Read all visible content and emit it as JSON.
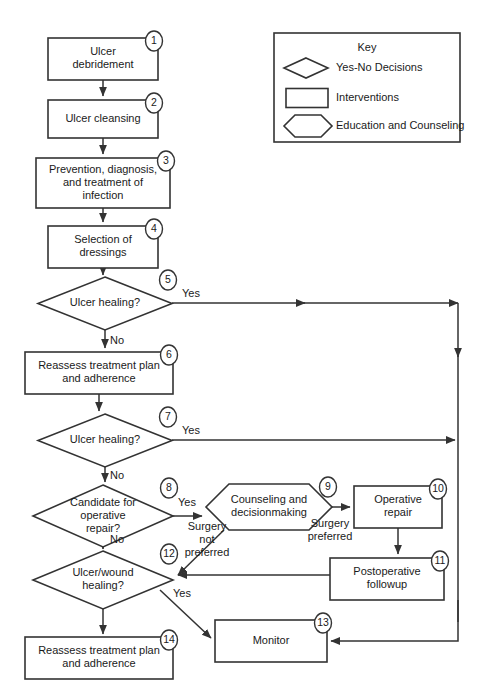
{
  "chart_data": {
    "type": "diagram",
    "diagram_kind": "clinical-algorithm-flowchart",
    "nodes": [
      {
        "id": 1,
        "badge": "1",
        "shape": "process",
        "lines": [
          "Ulcer",
          "debridement"
        ],
        "x": 48,
        "y": 38,
        "w": 110,
        "h": 42
      },
      {
        "id": 2,
        "badge": "2",
        "shape": "process",
        "lines": [
          "Ulcer cleansing"
        ],
        "x": 48,
        "y": 100,
        "w": 110,
        "h": 38
      },
      {
        "id": 3,
        "badge": "3",
        "shape": "process",
        "lines": [
          "Prevention, diagnosis,",
          "and treatment of",
          "infection"
        ],
        "x": 36,
        "y": 158,
        "w": 134,
        "h": 50
      },
      {
        "id": 4,
        "badge": "4",
        "shape": "process",
        "lines": [
          "Selection of",
          "dressings"
        ],
        "x": 48,
        "y": 226,
        "w": 110,
        "h": 42
      },
      {
        "id": 5,
        "badge": "5",
        "shape": "decision",
        "lines": [
          "Ulcer healing?"
        ],
        "x": 38,
        "y": 277,
        "w": 134,
        "h": 53
      },
      {
        "id": 6,
        "badge": "6",
        "shape": "process",
        "lines": [
          "Reassess treatment plan",
          "and adherence"
        ],
        "x": 25,
        "y": 352,
        "w": 148,
        "h": 42
      },
      {
        "id": 7,
        "badge": "7",
        "shape": "decision",
        "lines": [
          "Ulcer healing?"
        ],
        "x": 38,
        "y": 414,
        "w": 134,
        "h": 53
      },
      {
        "id": 8,
        "badge": "8",
        "shape": "decision",
        "lines": [
          "Candidate for",
          "operative",
          "repair?"
        ],
        "x": 33,
        "y": 485,
        "w": 140,
        "h": 62
      },
      {
        "id": 9,
        "badge": "9",
        "shape": "hexagon",
        "lines": [
          "Counseling and",
          "decisionmaking"
        ],
        "x": 206,
        "y": 484,
        "w": 126,
        "h": 46
      },
      {
        "id": 10,
        "badge": "10",
        "shape": "process",
        "lines": [
          "Operative",
          "repair"
        ],
        "x": 354,
        "y": 486,
        "w": 88,
        "h": 42
      },
      {
        "id": 11,
        "badge": "11",
        "shape": "process",
        "lines": [
          "Postoperative",
          "followup"
        ],
        "x": 330,
        "y": 558,
        "w": 114,
        "h": 42
      },
      {
        "id": 12,
        "badge": "12",
        "shape": "decision",
        "lines": [
          "Ulcer/wound",
          "healing?"
        ],
        "x": 33,
        "y": 551,
        "w": 140,
        "h": 58
      },
      {
        "id": 13,
        "badge": "13",
        "shape": "process",
        "lines": [
          "Monitor"
        ],
        "x": 215,
        "y": 620,
        "w": 112,
        "h": 42
      },
      {
        "id": 14,
        "badge": "14",
        "shape": "process",
        "lines": [
          "Reassess treatment plan",
          "and adherence"
        ],
        "x": 25,
        "y": 637,
        "w": 148,
        "h": 42
      }
    ],
    "edge_labels": [
      {
        "text": "Yes",
        "x": 191,
        "y": 294
      },
      {
        "text": "No",
        "x": 117,
        "y": 341
      },
      {
        "text": "Yes",
        "x": 191,
        "y": 431
      },
      {
        "text": "No",
        "x": 117,
        "y": 476
      },
      {
        "text": "Yes",
        "x": 187,
        "y": 503
      },
      {
        "text": "No",
        "x": 117,
        "y": 540
      },
      {
        "text": "Surgery",
        "x": 207,
        "y": 527
      },
      {
        "text": "not",
        "x": 207,
        "y": 540
      },
      {
        "text": "preferred",
        "x": 207,
        "y": 553
      },
      {
        "text": "Surgery",
        "x": 330,
        "y": 524
      },
      {
        "text": "preferred",
        "x": 330,
        "y": 537
      },
      {
        "text": "Yes",
        "x": 182,
        "y": 594
      }
    ],
    "connectors": [
      {
        "id": "e1-2",
        "d": "M 103 80 L 103 96",
        "arrow": true
      },
      {
        "id": "e2-3",
        "d": "M 103 138 L 103 154",
        "arrow": true
      },
      {
        "id": "e3-4",
        "d": "M 103 208 L 103 222",
        "arrow": true
      },
      {
        "id": "e4-5",
        "d": "M 103 268 L 103 275",
        "arrow": true
      },
      {
        "id": "e5-no",
        "d": "M 105 330 L 105 348",
        "arrow": true
      },
      {
        "id": "e6-7",
        "d": "M 99 394 L 99 411",
        "arrow": true
      },
      {
        "id": "e7-no",
        "d": "M 105 467 L 105 482",
        "arrow": true
      },
      {
        "id": "e8-no",
        "d": "M 103 547 L 103 549",
        "arrow": true
      },
      {
        "id": "e12-no",
        "d": "M 103 609 L 103 634",
        "arrow": true
      },
      {
        "id": "e5-yes",
        "d": "M 172 303 L 458 303",
        "arrow": true,
        "mid_arrow_x": 305
      },
      {
        "id": "e5-down",
        "d": "M 458 303 L 458 622",
        "arrow": false
      },
      {
        "id": "e5-tick",
        "d": "M 458 353 L 458 357",
        "arrow": true
      },
      {
        "id": "e7-yes",
        "d": "M 172 440 L 455 440",
        "arrow": true
      },
      {
        "id": "e8-yes",
        "d": "M 173 516 L 202 516",
        "arrow": true
      },
      {
        "id": "e9-10",
        "d": "M 332 507 L 350 507",
        "arrow": true
      },
      {
        "id": "e10-11",
        "d": "M 398 528 L 398 554",
        "arrow": true
      },
      {
        "id": "e9-12",
        "d": "M 224 530 L 178 575",
        "arrow": true
      },
      {
        "id": "e11-12",
        "d": "M 330 575 L 178 575",
        "arrow": true
      },
      {
        "id": "e12-yes",
        "d": "M 160 590 L 211 638",
        "arrow": true
      },
      {
        "id": "e11-down",
        "d": "M 458 600 L 458 641 L 331 641",
        "arrow": true
      }
    ]
  },
  "key": {
    "title": "Key",
    "box": {
      "x": 274,
      "y": 33,
      "w": 186,
      "h": 109
    },
    "items": [
      {
        "icon": "diamond-shape",
        "label": "Yes-No Decisions"
      },
      {
        "icon": "rectangle-shape",
        "label": "Interventions"
      },
      {
        "icon": "hexagon-shape",
        "label": "Education and Counseling"
      }
    ]
  },
  "colors": {
    "stroke": "#333333",
    "fill": "#ffffff",
    "text": "#1a1a1a",
    "background": "#ffffff"
  }
}
